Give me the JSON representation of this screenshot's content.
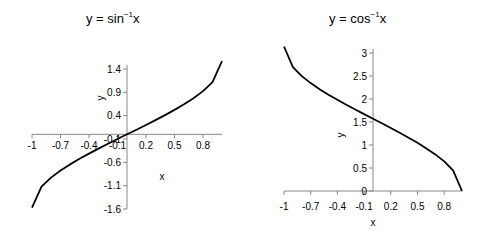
{
  "chart_data": [
    {
      "type": "line",
      "title": "y = sin⁻¹x",
      "title_base": "y = sin",
      "title_sup": "−1",
      "title_tail": "x",
      "xlabel": "x",
      "ylabel": "y",
      "x_ticks": [
        "-1",
        "-0.7",
        "-0.4",
        "-0.1",
        "0.2",
        "0.5",
        "0.8"
      ],
      "y_ticks": [
        "1.4",
        "0.9",
        "0.4",
        "-0.1",
        "-0.6",
        "-1.1",
        "-1.6"
      ],
      "xlim": [
        -1,
        1
      ],
      "ylim": [
        -1.6,
        1.6
      ],
      "grid": false,
      "legend": null,
      "x": [
        -1,
        -0.9,
        -0.8,
        -0.7,
        -0.6,
        -0.5,
        -0.4,
        -0.3,
        -0.2,
        -0.1,
        0,
        0.1,
        0.2,
        0.3,
        0.4,
        0.5,
        0.6,
        0.7,
        0.8,
        0.9,
        1
      ],
      "values": [
        -1.571,
        -1.12,
        -0.927,
        -0.775,
        -0.644,
        -0.524,
        -0.412,
        -0.305,
        -0.201,
        -0.1,
        0,
        0.1,
        0.201,
        0.305,
        0.412,
        0.524,
        0.644,
        0.775,
        0.927,
        1.12,
        1.571
      ]
    },
    {
      "type": "line",
      "title": "y = cos⁻¹x",
      "title_base": "y = cos",
      "title_sup": "−1",
      "title_tail": "x",
      "xlabel": "x",
      "ylabel": "y",
      "x_ticks": [
        "-1",
        "-0.7",
        "-0.4",
        "-0.1",
        "0.2",
        "0.5",
        "0.8"
      ],
      "y_ticks": [
        "3",
        "2.5",
        "2",
        "1.5",
        "1",
        "0.5",
        "0"
      ],
      "xlim": [
        -1,
        1
      ],
      "ylim": [
        0,
        3
      ],
      "grid": false,
      "legend": null,
      "x": [
        -1,
        -0.9,
        -0.8,
        -0.7,
        -0.6,
        -0.5,
        -0.4,
        -0.3,
        -0.2,
        -0.1,
        0,
        0.1,
        0.2,
        0.3,
        0.4,
        0.5,
        0.6,
        0.7,
        0.8,
        0.9,
        1
      ],
      "values": [
        3.142,
        2.691,
        2.498,
        2.346,
        2.214,
        2.094,
        1.982,
        1.875,
        1.772,
        1.671,
        1.571,
        1.471,
        1.369,
        1.266,
        1.159,
        1.047,
        0.927,
        0.795,
        0.644,
        0.451,
        0
      ]
    }
  ]
}
